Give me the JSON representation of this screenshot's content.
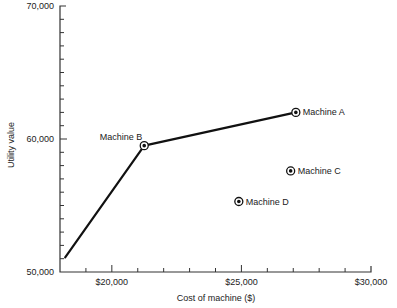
{
  "chart_data": {
    "type": "scatter",
    "title": "",
    "xlabel": "Cost of machine ($)",
    "ylabel": "Utility value",
    "xlim": [
      18000,
      30000
    ],
    "ylim": [
      50000,
      70000
    ],
    "x_ticks": [
      {
        "value": 20000,
        "label": "$20,000"
      },
      {
        "value": 25000,
        "label": "$25,000"
      },
      {
        "value": 30000,
        "label": "$30,000"
      }
    ],
    "x_minor_step": 1000,
    "y_ticks": [
      {
        "value": 50000,
        "label": "50,000"
      },
      {
        "value": 60000,
        "label": "60,000"
      },
      {
        "value": 70000,
        "label": "70,000"
      }
    ],
    "y_minor_step": 1000,
    "grid": false,
    "legend": "none",
    "frontier_line": {
      "name": "Efficient frontier",
      "x": [
        18200,
        21250,
        27100
      ],
      "y": [
        51100,
        59500,
        62000
      ]
    },
    "points": [
      {
        "name": "Machine A",
        "label": "Machine A",
        "x": 27100,
        "y": 62000,
        "label_side": "right"
      },
      {
        "name": "Machine B",
        "label": "Machine B",
        "x": 21250,
        "y": 59500,
        "label_side": "upper-left"
      },
      {
        "name": "Machine C",
        "label": "Machine C",
        "x": 26900,
        "y": 57600,
        "label_side": "right"
      },
      {
        "name": "Machine D",
        "label": "Machine D",
        "x": 24900,
        "y": 55300,
        "label_side": "right"
      }
    ]
  },
  "style": {
    "line_color": "#111111",
    "axis_color": "#333333",
    "background": "#ffffff"
  }
}
